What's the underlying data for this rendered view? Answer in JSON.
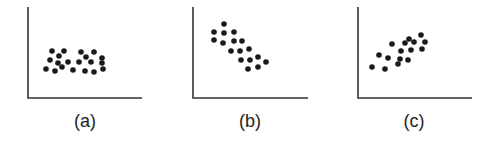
{
  "figure": {
    "axis_color": "#333333",
    "dot_color": "#1a1a1a",
    "panels": [
      {
        "label": "(a)",
        "description": "no correlation",
        "axes": {
          "x0": 28,
          "y_top": 7,
          "y0": 98,
          "x_end": 142
        },
        "points": [
          [
            52,
            51
          ],
          [
            64,
            51
          ],
          [
            81,
            52
          ],
          [
            94,
            52
          ],
          [
            50,
            60
          ],
          [
            59,
            56
          ],
          [
            58,
            63
          ],
          [
            68,
            62
          ],
          [
            79,
            62
          ],
          [
            86,
            57
          ],
          [
            91,
            62
          ],
          [
            102,
            58
          ],
          [
            102,
            63
          ],
          [
            46,
            69
          ],
          [
            55,
            71
          ],
          [
            62,
            67
          ],
          [
            73,
            70
          ],
          [
            85,
            71
          ],
          [
            94,
            72
          ],
          [
            103,
            69
          ]
        ]
      },
      {
        "label": "(b)",
        "description": "negative correlation",
        "axes": {
          "x0": 193,
          "y_top": 7,
          "y0": 98,
          "x_end": 308
        },
        "points": [
          [
            224,
            24
          ],
          [
            214,
            32
          ],
          [
            224,
            33
          ],
          [
            234,
            32
          ],
          [
            214,
            40
          ],
          [
            223,
            43
          ],
          [
            234,
            41
          ],
          [
            242,
            41
          ],
          [
            231,
            51
          ],
          [
            240,
            51
          ],
          [
            249,
            49
          ],
          [
            241,
            60
          ],
          [
            250,
            60
          ],
          [
            258,
            57
          ],
          [
            266,
            62
          ],
          [
            248,
            69
          ],
          [
            258,
            67
          ]
        ]
      },
      {
        "label": "(c)",
        "description": "positive correlation",
        "axes": {
          "x0": 358,
          "y_top": 7,
          "y0": 98,
          "x_end": 472
        },
        "points": [
          [
            421,
            35
          ],
          [
            409,
            39
          ],
          [
            405,
            43
          ],
          [
            414,
            42
          ],
          [
            392,
            44
          ],
          [
            425,
            42
          ],
          [
            401,
            51
          ],
          [
            411,
            50
          ],
          [
            422,
            49
          ],
          [
            379,
            55
          ],
          [
            388,
            58
          ],
          [
            400,
            59
          ],
          [
            408,
            60
          ],
          [
            398,
            64
          ],
          [
            372,
            67
          ],
          [
            385,
            69
          ]
        ]
      }
    ]
  },
  "chart_data": [
    {
      "type": "scatter",
      "title": "(a)",
      "xlabel": "",
      "ylabel": "",
      "grid": false,
      "relationship": "no correlation",
      "x": [
        52,
        64,
        81,
        94,
        50,
        59,
        58,
        68,
        79,
        86,
        91,
        102,
        102,
        46,
        55,
        62,
        73,
        85,
        94,
        103
      ],
      "y": [
        47,
        47,
        46,
        46,
        38,
        42,
        35,
        36,
        36,
        41,
        36,
        40,
        35,
        29,
        27,
        31,
        28,
        27,
        26,
        29
      ]
    },
    {
      "type": "scatter",
      "title": "(b)",
      "xlabel": "",
      "ylabel": "",
      "grid": false,
      "relationship": "negative correlation",
      "x": [
        31,
        21,
        31,
        41,
        21,
        30,
        41,
        49,
        38,
        47,
        56,
        48,
        57,
        65,
        73,
        55,
        65
      ],
      "y": [
        74,
        66,
        65,
        66,
        58,
        55,
        57,
        57,
        47,
        47,
        49,
        38,
        38,
        41,
        36,
        29,
        31
      ]
    },
    {
      "type": "scatter",
      "title": "(c)",
      "xlabel": "",
      "ylabel": "",
      "grid": false,
      "relationship": "positive correlation",
      "x": [
        63,
        51,
        47,
        56,
        34,
        67,
        43,
        53,
        64,
        21,
        30,
        42,
        50,
        40,
        14,
        27
      ],
      "y": [
        63,
        59,
        55,
        56,
        54,
        56,
        47,
        48,
        49,
        43,
        40,
        39,
        38,
        34,
        31,
        29
      ]
    }
  ]
}
